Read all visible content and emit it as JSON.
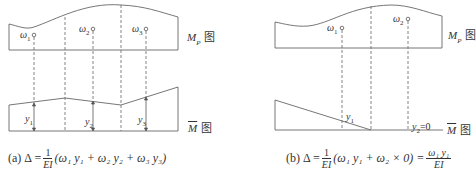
{
  "diagrams": [
    {
      "id": "a",
      "top_label": {
        "main": "M",
        "sub": "P",
        "suffix": "图"
      },
      "bottom_label": {
        "main": "M",
        "suffix": "图"
      },
      "areas": [
        {
          "name": "ω",
          "sub": "1"
        },
        {
          "name": "ω",
          "sub": "2"
        },
        {
          "name": "ω",
          "sub": "3"
        }
      ],
      "ordinates": [
        {
          "name": "y",
          "sub": "1"
        },
        {
          "name": "y",
          "sub": "2"
        },
        {
          "name": "y",
          "sub": "3"
        }
      ],
      "formula": {
        "prefix": "(a)",
        "lhs": "Δ =",
        "frac_num": "1",
        "frac_den": "EI",
        "body": "(ω₁ y₁ + ω₂ y₂ + ω₃ y₃)"
      }
    },
    {
      "id": "b",
      "top_label": {
        "main": "M",
        "sub": "P",
        "suffix": "图"
      },
      "bottom_label": {
        "main": "M",
        "suffix": "图"
      },
      "areas": [
        {
          "name": "ω",
          "sub": "1"
        },
        {
          "name": "ω",
          "sub": "2"
        }
      ],
      "ordinates": [
        {
          "name": "y",
          "sub": "1"
        },
        {
          "name": "y",
          "sub": "2",
          "suffix": "=0"
        }
      ],
      "formula": {
        "prefix": "(b)",
        "lhs": "Δ =",
        "frac_num": "1",
        "frac_den": "EI",
        "body": "(ω₁ y₁ + ω₂ × 0) =",
        "result_num": "ω₁ y₁",
        "result_den": "EI"
      }
    }
  ],
  "colors": {
    "line": "#555555",
    "text": "#333333",
    "background": "#ffffff"
  }
}
